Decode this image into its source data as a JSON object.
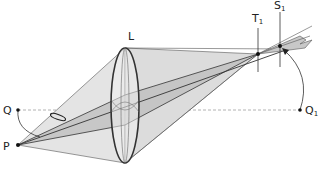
{
  "figure": {
    "type": "optics-diagram"
  },
  "labels": {
    "lens": "L",
    "tangential_focus": "T",
    "tangential_focus_sub": "1",
    "sagittal_focus": "S",
    "sagittal_focus_sub": "1",
    "object_point": "P",
    "axis_point": "Q",
    "image_axis_point": "Q",
    "image_axis_point_sub": "1"
  },
  "colors": {
    "cone_fill": "#d9d9d9",
    "cone_inner_fill": "#bdbdbd",
    "line": "#333333",
    "axis_dash": "#999999",
    "lens_stroke": "#333333"
  },
  "points": {
    "P": [
      18,
      145
    ],
    "Q": [
      18,
      110
    ],
    "Q1": [
      300,
      110
    ],
    "T1": [
      258,
      54
    ],
    "S1": [
      280,
      46
    ]
  }
}
